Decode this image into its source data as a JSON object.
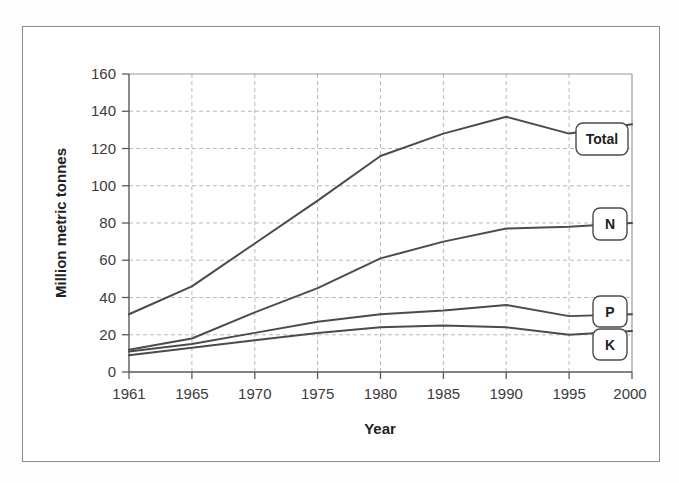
{
  "chart_data": {
    "type": "line",
    "title": "",
    "xlabel": "Year",
    "ylabel": "Million metric tonnes",
    "categories": [
      "1961",
      "1965",
      "1970",
      "1975",
      "1980",
      "1985",
      "1990",
      "1995",
      "2000"
    ],
    "xlim": [
      0,
      8
    ],
    "ylim": [
      0,
      160
    ],
    "yticks": [
      0,
      20,
      40,
      60,
      80,
      100,
      120,
      140,
      160
    ],
    "grid": true,
    "legend_position": "right-inline-labels",
    "series": [
      {
        "name": "Total",
        "label": "Total",
        "values": [
          31,
          46,
          69,
          92,
          116,
          128,
          137,
          128,
          133
        ],
        "color": "#4b4b4b"
      },
      {
        "name": "N",
        "label": "N",
        "values": [
          12,
          18,
          32,
          45,
          61,
          70,
          77,
          78,
          80
        ],
        "color": "#4b4b4b"
      },
      {
        "name": "P",
        "label": "P",
        "values": [
          11,
          15,
          21,
          27,
          31,
          33,
          36,
          30,
          31
        ],
        "color": "#4b4b4b"
      },
      {
        "name": "K",
        "label": "K",
        "values": [
          9,
          13,
          17,
          21,
          24,
          25,
          24,
          20,
          22
        ],
        "color": "#4b4b4b"
      }
    ]
  },
  "axis": {
    "ytick_labels": [
      "0",
      "20",
      "40",
      "60",
      "80",
      "100",
      "120",
      "140",
      "160"
    ],
    "xtick_labels": [
      "1961",
      "1965",
      "1970",
      "1975",
      "1980",
      "1985",
      "1990",
      "1995",
      "2000"
    ],
    "x_title": "Year",
    "y_title": "Million metric tonnes"
  },
  "legend": {
    "items": [
      {
        "label": "Total"
      },
      {
        "label": "N"
      },
      {
        "label": "P"
      },
      {
        "label": "K"
      }
    ]
  },
  "colors": {
    "line": "#4b4b4b",
    "grid": "#b9b9c4",
    "frame": "#8d8d8d",
    "text": "#222222",
    "background": "#ffffff"
  }
}
